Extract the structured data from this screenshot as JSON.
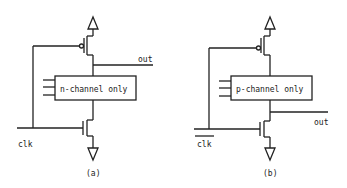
{
  "figure": {
    "panels": [
      {
        "id": "a",
        "caption": "(a)",
        "block_label": "n-channel only",
        "output_label": "out",
        "clock_label": "clk",
        "clock_inverted": false
      },
      {
        "id": "b",
        "caption": "(b)",
        "block_label": "p-channel only",
        "output_label": "out",
        "clock_label": "clk",
        "clock_inverted": true
      }
    ]
  }
}
